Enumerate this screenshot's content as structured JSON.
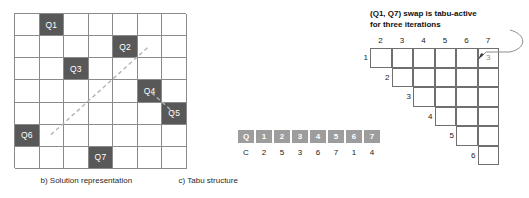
{
  "figure": {
    "panels": [
      {
        "id": "a",
        "caption": "a) New solution after swapping Q1 and Q7"
      },
      {
        "id": "b",
        "caption": "b) Solution representation"
      },
      {
        "id": "c",
        "caption": "c) Tabu structure"
      }
    ]
  },
  "board": {
    "columns": 7,
    "rows": 7,
    "queen_color": "#585858",
    "grid_line_color": "#8a8a8a",
    "queens": [
      {
        "label": "Q1",
        "col": 2,
        "row": 1
      },
      {
        "label": "Q2",
        "col": 5,
        "row": 2
      },
      {
        "label": "Q3",
        "col": 3,
        "row": 3
      },
      {
        "label": "Q4",
        "col": 6,
        "row": 4
      },
      {
        "label": "Q5",
        "col": 7,
        "row": 5
      },
      {
        "label": "Q6",
        "col": 1,
        "row": 6
      },
      {
        "label": "Q7",
        "col": 4,
        "row": 7
      }
    ],
    "diagonal_line": {
      "style": "dashed",
      "color": "#b4b4b4"
    }
  },
  "solution_representation": {
    "header_row": [
      "Q",
      "1",
      "2",
      "3",
      "4",
      "5",
      "6",
      "7"
    ],
    "value_row": [
      "C",
      "2",
      "5",
      "3",
      "6",
      "7",
      "1",
      "4"
    ],
    "cell_fill": "#9d9d9d"
  },
  "tabu_structure": {
    "annotation_line1": "(Q1, Q7) swap is tabu-active",
    "annotation_line2": "for three iterations",
    "column_labels": [
      "2",
      "3",
      "4",
      "5",
      "6",
      "7"
    ],
    "row_labels": [
      "1",
      "2",
      "3",
      "4",
      "5",
      "6"
    ],
    "entries": [
      {
        "row": 1,
        "col": 7,
        "value": "3"
      }
    ],
    "row_spans": [
      {
        "row": 1,
        "start_col": 2,
        "end_col": 7
      },
      {
        "row": 2,
        "start_col": 3,
        "end_col": 7
      },
      {
        "row": 3,
        "start_col": 4,
        "end_col": 7
      },
      {
        "row": 4,
        "start_col": 5,
        "end_col": 7
      },
      {
        "row": 5,
        "start_col": 6,
        "end_col": 7
      },
      {
        "row": 6,
        "start_col": 7,
        "end_col": 7
      }
    ]
  }
}
